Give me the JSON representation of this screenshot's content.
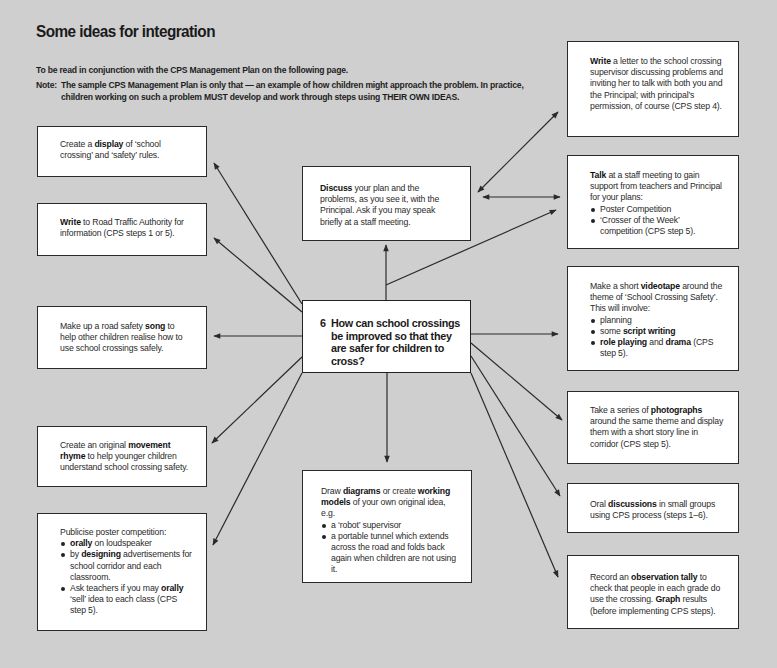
{
  "header": {
    "title": "Some ideas for integration",
    "subtitle": "To be read in conjunction with the CPS Management Plan on the following page.",
    "note_label": "Note:",
    "note_text": "The sample CPS Management Plan is only that — an example of how children might approach the problem. In practice, children working on such a problem MUST develop and work through steps using THEIR OWN IDEAS."
  },
  "central": {
    "number": "6",
    "question": "How can school crossings be improved so that they are safer for children to cross?"
  },
  "boxes": {
    "write_letter": {
      "bold": "Write",
      "text": " a letter to the school crossing supervisor discussing problems and inviting her to talk with both you and the Principal; with principal’s permission, of course (CPS step 4)."
    },
    "create_display": {
      "pre": "Create a ",
      "bold": "display",
      "post": " of ‘school crossing’ and ‘safety’ rules."
    },
    "discuss": {
      "bold": "Discuss",
      "text": " your plan and the problems, as you see it, with the Principal. Ask if you may speak briefly at a staff meeting."
    },
    "talk": {
      "bold": "Talk",
      "text": " at a staff meeting to gain support from teachers and Principal for your plans:",
      "items": [
        "Poster Competition",
        "‘Crosser of the Week’ competition (CPS step 5)."
      ]
    },
    "write_rta": {
      "bold": "Write",
      "text": " to Road Traffic Authority for information (CPS steps 1 or 5)."
    },
    "videotape": {
      "pre": "Make a short ",
      "bold": "videotape",
      "post": " around the theme of ‘School Crossing Safety’. This will involve:",
      "item1": "planning",
      "item2_pre": "some ",
      "item2_bold": "script writing",
      "item3_bold1": "role playing",
      "item3_mid": " and ",
      "item3_bold2": "drama",
      "item3_post": " (CPS step 5)."
    },
    "song": {
      "pre": "Make up a road safety ",
      "bold": "song",
      "post": " to help other children realise how to use school crossings safely."
    },
    "movement_rhyme": {
      "pre": "Create an original ",
      "bold": "movement rhyme",
      "post": " to help younger children understand school crossing safety."
    },
    "draw_diagrams": {
      "pre": "Draw ",
      "bold1": "diagrams",
      "mid": " or create ",
      "bold2": "working models",
      "post": " of your own original idea, e.g.",
      "items": [
        "a ‘robot’ supervisor",
        "a portable tunnel which extends across the road and folds back again when children are not using it."
      ]
    },
    "photographs": {
      "pre": "Take a series of ",
      "bold": "photographs",
      "post": " around the same theme and display them with a short story line in corridor (CPS step 5)."
    },
    "oral_discussions": {
      "pre": "Oral ",
      "bold": "discussions",
      "post": " in small groups using CPS process (steps 1–6)."
    },
    "publicise": {
      "intro": "Publicise poster competition:",
      "item1_bold": "orally",
      "item1_post": " on loudspeaker",
      "item2_pre": "by ",
      "item2_bold": "designing",
      "item2_post": " advertisements for school corridor and each classroom.",
      "item3_pre": "Ask teachers if you may ",
      "item3_bold": "orally",
      "item3_post": " ‘sell’ idea to each class (CPS step 5)."
    },
    "record_tally": {
      "pre": "Record an ",
      "bold1": "observation tally",
      "mid": " to check that people in each grade do use the crossing. ",
      "bold2": "Graph",
      "post": " results (before implementing CPS steps)."
    }
  },
  "colors": {
    "background": "#cfcfcf",
    "box_fill": "#ffffff",
    "line": "#2a2a2a"
  }
}
